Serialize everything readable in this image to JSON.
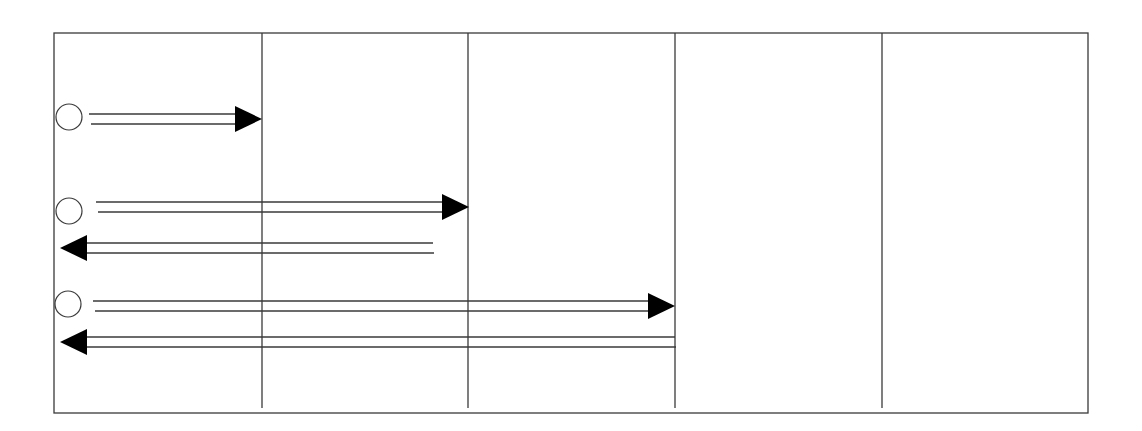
{
  "diagram": {
    "type": "message-sequence",
    "colors": {
      "line": "#3a3a3a",
      "arrowhead": "#000000",
      "background": "#ffffff"
    },
    "frame": {
      "x1": 54,
      "y1": 33,
      "x2": 1088,
      "y2": 413
    },
    "lanes": [
      {
        "x": 262,
        "y_end": 408
      },
      {
        "x": 468,
        "y_end": 408
      },
      {
        "x": 675,
        "y_end": 408
      },
      {
        "x": 882,
        "y_end": 408
      }
    ],
    "rows": [
      {
        "circle": {
          "cx": 69,
          "cy": 117,
          "r": 13
        },
        "forward": {
          "x1": 89,
          "x2": 262,
          "y": 119,
          "head": "right"
        },
        "return": null
      },
      {
        "circle": {
          "cx": 69,
          "cy": 211,
          "r": 13
        },
        "forward": {
          "x1": 96,
          "x2": 469,
          "y": 207,
          "head": "right"
        },
        "return": {
          "x1": 433,
          "x2": 60,
          "y": 248,
          "head": "left"
        }
      },
      {
        "circle": {
          "cx": 68,
          "cy": 304,
          "r": 13
        },
        "forward": {
          "x1": 93,
          "x2": 675,
          "y": 306,
          "head": "right"
        },
        "return": {
          "x1": 675,
          "x2": 60,
          "y": 342,
          "head": "left"
        }
      }
    ]
  }
}
